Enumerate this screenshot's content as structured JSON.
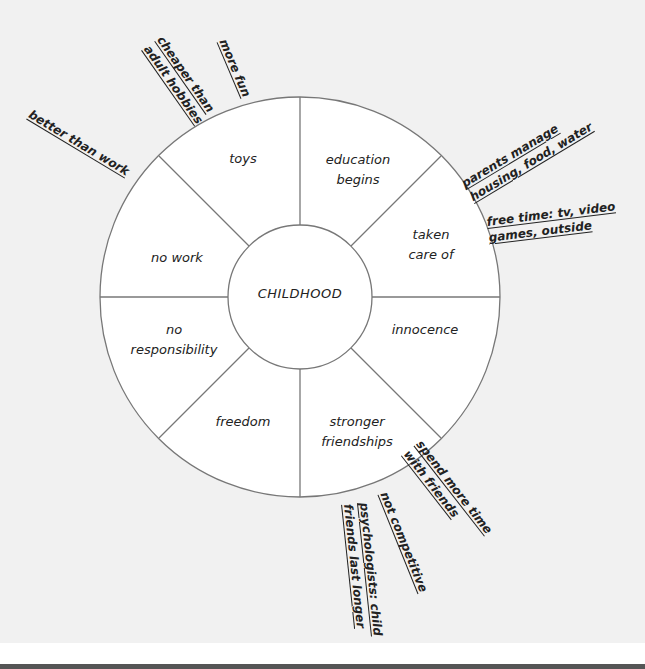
{
  "diagram": {
    "center": "CHILDHOOD",
    "segments": [
      {
        "label": "toys",
        "lines": [
          "toys"
        ]
      },
      {
        "label": "education begins",
        "lines": [
          "education",
          "begins"
        ]
      },
      {
        "label": "taken care of",
        "lines": [
          "taken",
          "care of"
        ]
      },
      {
        "label": "innocence",
        "lines": [
          "innocence"
        ]
      },
      {
        "label": "stronger friendships",
        "lines": [
          "stronger",
          "friendships"
        ]
      },
      {
        "label": "freedom",
        "lines": [
          "freedom"
        ]
      },
      {
        "label": "no responsibility",
        "lines": [
          "no",
          "responsibility"
        ]
      },
      {
        "label": "no work",
        "lines": [
          "no work"
        ]
      }
    ],
    "notes": [
      {
        "attached_to": "toys",
        "lines": [
          "more fun"
        ]
      },
      {
        "attached_to": "toys",
        "lines": [
          "cheaper than",
          "adult hobbies"
        ]
      },
      {
        "attached_to": "no work",
        "lines": [
          "better than work"
        ]
      },
      {
        "attached_to": "taken care of",
        "lines": [
          "parents manage",
          "housing, food, water"
        ]
      },
      {
        "attached_to": "taken care of",
        "lines": [
          "free time: tv, video",
          "games, outside"
        ]
      },
      {
        "attached_to": "stronger friendships",
        "lines": [
          "spend more time",
          "with friends"
        ]
      },
      {
        "attached_to": "stronger friendships",
        "lines": [
          "not competitive"
        ]
      },
      {
        "attached_to": "stronger friendships",
        "lines": [
          "psychologists: child",
          "friends last longer"
        ]
      }
    ],
    "colors": {
      "background": "#f1f1f1",
      "wheel_fill": "#ffffff",
      "stroke": "#777777",
      "text": "#222222"
    }
  }
}
